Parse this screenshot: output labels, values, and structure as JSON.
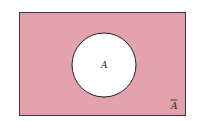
{
  "diagram": {
    "type": "venn",
    "universe": {
      "fill": "#e4a3ac",
      "stroke": "#3a3a3a"
    },
    "set": {
      "label": "A",
      "fill": "#ffffff",
      "stroke": "#222222"
    },
    "complement_label": "A",
    "complement_overline": true
  }
}
